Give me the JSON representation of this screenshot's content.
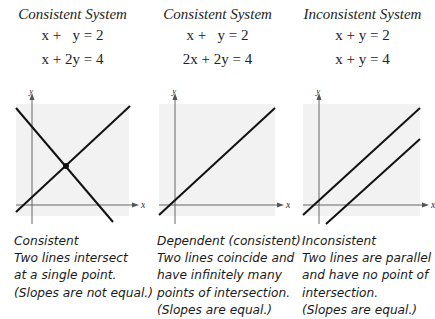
{
  "panels": [
    {
      "title": "Consistent System",
      "equations": [
        "x +   y = 2",
        "x + 2y = 4"
      ],
      "axis_labels": {
        "x": "x",
        "y": "y"
      },
      "caption": [
        "Consistent",
        "Two lines intersect",
        "at a single point.",
        "(Slopes are not equal.)"
      ]
    },
    {
      "title": "Consistent System",
      "equations": [
        "x +   y = 2",
        "2x + 2y = 4"
      ],
      "axis_labels": {
        "x": "x",
        "y": "y"
      },
      "caption": [
        "Dependent (consistent)",
        "Two lines coincide and",
        "have infinitely many",
        "points of intersection.",
        "(Slopes are equal.)"
      ]
    },
    {
      "title": "Inconsistent System",
      "equations": [
        "x + y = 2",
        "x + y = 4"
      ],
      "axis_labels": {
        "x": "x",
        "y": "y"
      },
      "caption": [
        "Inconsistent",
        "Two lines are parallel",
        "and have no point of",
        "intersection.",
        "(Slopes are equal.)"
      ]
    }
  ],
  "colors": {
    "background": "#ffffff",
    "plot_area": "#f2f2f2",
    "line": "#111111",
    "axis": "#555555"
  }
}
